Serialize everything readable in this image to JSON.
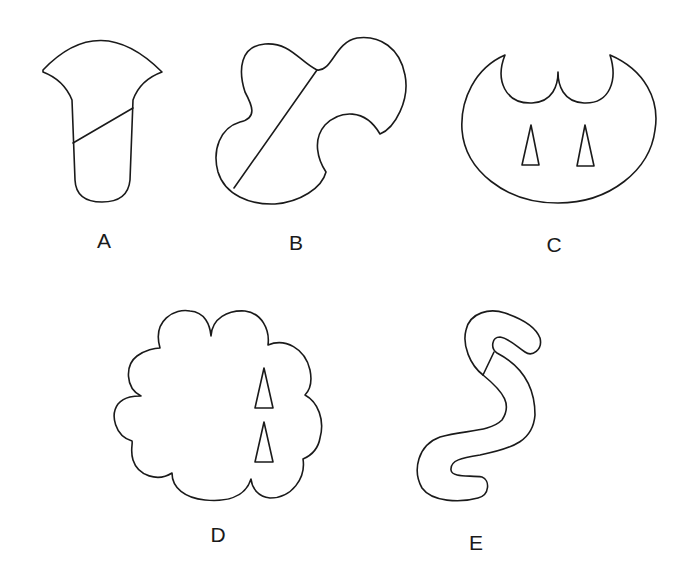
{
  "figure": {
    "stroke_color": "#1a1a1a",
    "background": "#ffffff",
    "shapes": [
      {
        "id": "A",
        "label": "A",
        "description": "Funnel/trumpet shape with a diagonal dividing line across its stem"
      },
      {
        "id": "B",
        "label": "B",
        "description": "Lobed irregular blob with a long diagonal dividing line"
      },
      {
        "id": "C",
        "label": "C",
        "description": "Oval with two scalloped notches on top and two small triangles inside"
      },
      {
        "id": "D",
        "label": "D",
        "description": "Cloud-like scalloped shape with two small triangles near the right edge"
      },
      {
        "id": "E",
        "label": "E",
        "description": "Worm/S-shaped tube with a short dividing line near the top"
      }
    ]
  }
}
